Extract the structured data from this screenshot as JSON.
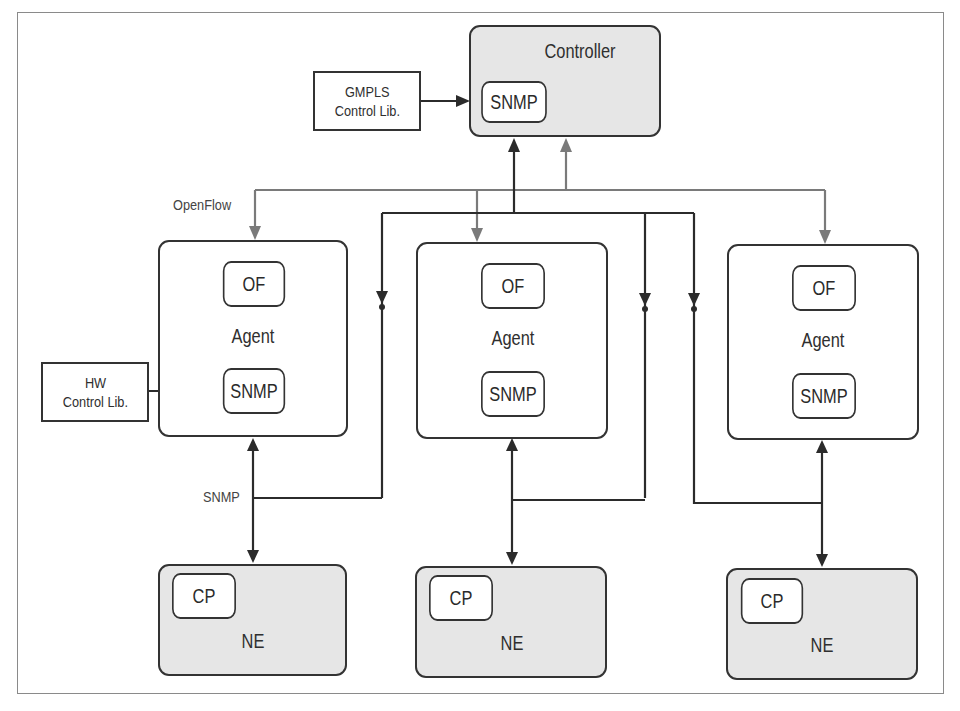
{
  "controller": {
    "title": "Controller",
    "module": "SNMP"
  },
  "gmpls_lib": {
    "line1": "GMPLS",
    "line2": "Control Lib."
  },
  "hw_lib": {
    "line1": "HW",
    "line2": "Control Lib."
  },
  "edge_labels": {
    "openflow": "OpenFlow",
    "snmp": "SNMP"
  },
  "agents": [
    {
      "title": "Agent",
      "of_module": "OF",
      "snmp_module": "SNMP"
    },
    {
      "title": "Agent",
      "of_module": "OF",
      "snmp_module": "SNMP"
    },
    {
      "title": "Agent",
      "of_module": "OF",
      "snmp_module": "SNMP"
    }
  ],
  "network_elements": [
    {
      "title": "NE",
      "module": "CP"
    },
    {
      "title": "NE",
      "module": "CP"
    },
    {
      "title": "NE",
      "module": "CP"
    }
  ],
  "colors": {
    "snmp_link": "#2b2b2b",
    "openflow_link": "#7a7a7a",
    "box_fill_gray": "#e6e6e6",
    "frame": "#8a8a8a"
  }
}
